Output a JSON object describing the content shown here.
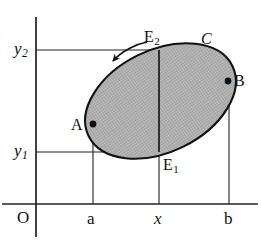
{
  "figure": {
    "background_color": "#ffffff",
    "ink_color": "#101010",
    "fill_color": "#b4b4b4"
  },
  "axes": {
    "origin_label": "O",
    "x_axis_name": "x-axis",
    "y_axis_name": "y-axis",
    "x_ticks": [
      {
        "label": "a",
        "italic": false,
        "x": 93
      },
      {
        "label": "x",
        "italic": true,
        "x": 159
      },
      {
        "label": "b",
        "italic": false,
        "x": 229
      }
    ],
    "y_ticks": [
      {
        "label": "y",
        "subscript": "2",
        "italic": true,
        "y": 50
      },
      {
        "label": "y",
        "subscript": "1",
        "italic": true,
        "y": 152
      }
    ]
  },
  "region": {
    "curve_label": "C",
    "curve_label_italic": true,
    "fill": "#b4b4b4"
  },
  "points": [
    {
      "name": "A",
      "subscript": "",
      "italic": false,
      "x": 93,
      "y": 124,
      "dot": true
    },
    {
      "name": "B",
      "subscript": "",
      "italic": false,
      "x": 228,
      "y": 81,
      "dot": true
    },
    {
      "name": "E",
      "subscript": "2",
      "italic": false,
      "x": 159,
      "y": 50,
      "dot": false
    },
    {
      "name": "E",
      "subscript": "1",
      "italic": false,
      "x": 159,
      "y": 152,
      "dot": false
    }
  ],
  "annotations": [
    {
      "name": "direction-arrow",
      "description": "curved arrow indicating counterclockwise orientation along upper boundary"
    }
  ]
}
